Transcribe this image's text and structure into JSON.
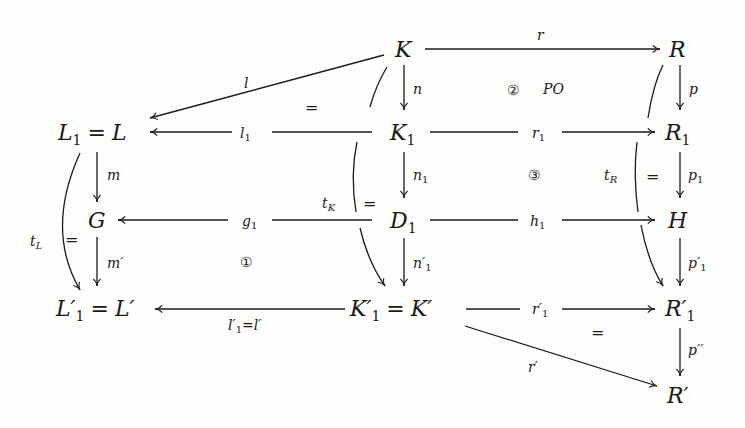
{
  "diagram": {
    "nodes": [
      {
        "id": "K",
        "label": "K",
        "x": 408,
        "y": 52
      },
      {
        "id": "R",
        "label": "R",
        "x": 682,
        "y": 52
      },
      {
        "id": "L1L",
        "label": "L₁ = L",
        "x": 108,
        "y": 135
      },
      {
        "id": "K1",
        "label": "K₁",
        "x": 404,
        "y": 135
      },
      {
        "id": "R1",
        "label": "R₁",
        "x": 682,
        "y": 135
      },
      {
        "id": "G",
        "label": "G",
        "x": 97,
        "y": 223
      },
      {
        "id": "D1",
        "label": "D₁",
        "x": 404,
        "y": 223
      },
      {
        "id": "H",
        "label": "H",
        "x": 680,
        "y": 223
      },
      {
        "id": "L1pLp",
        "label": "L′₁ = L′",
        "x": 118,
        "y": 310
      },
      {
        "id": "K1pKp",
        "label": "K′₁ = K′",
        "x": 393,
        "y": 310
      },
      {
        "id": "R1p",
        "label": "R′₁",
        "x": 682,
        "y": 310
      },
      {
        "id": "Rp",
        "label": "R′",
        "x": 682,
        "y": 395
      }
    ],
    "edges": [
      {
        "id": "r",
        "label": "r",
        "from": "K",
        "to": "R"
      },
      {
        "id": "l",
        "label": "l",
        "from": "K",
        "to": "L1L"
      },
      {
        "id": "n",
        "label": "n",
        "from": "K",
        "to": "K1"
      },
      {
        "id": "p",
        "label": "p",
        "from": "R",
        "to": "R1"
      },
      {
        "id": "l1",
        "label": "l₁",
        "from": "K1",
        "to": "L1L"
      },
      {
        "id": "r1",
        "label": "r₁",
        "from": "K1",
        "to": "R1"
      },
      {
        "id": "m",
        "label": "m",
        "from": "L1L",
        "to": "G"
      },
      {
        "id": "n1",
        "label": "n₁",
        "from": "K1",
        "to": "D1"
      },
      {
        "id": "p1",
        "label": "p₁",
        "from": "R1",
        "to": "H"
      },
      {
        "id": "g1",
        "label": "g₁",
        "from": "D1",
        "to": "G"
      },
      {
        "id": "h1",
        "label": "h₁",
        "from": "D1",
        "to": "H"
      },
      {
        "id": "mp",
        "label": "m′",
        "from": "G",
        "to": "L1pLp"
      },
      {
        "id": "n1p",
        "label": "n′₁",
        "from": "D1",
        "to": "K1pKp"
      },
      {
        "id": "p1p",
        "label": "p′₁",
        "from": "H",
        "to": "R1p"
      },
      {
        "id": "l1p",
        "label": "l′₁=l′",
        "from": "K1pKp",
        "to": "L1pLp"
      },
      {
        "id": "r1p",
        "label": "r′₁",
        "from": "K1pKp",
        "to": "R1p"
      },
      {
        "id": "ppp",
        "label": "p′′",
        "from": "R1p",
        "to": "Rp"
      },
      {
        "id": "rp",
        "label": "r′",
        "from": "K1pKp",
        "to": "Rp"
      },
      {
        "id": "tL",
        "label": "tL",
        "from": "L1L",
        "to": "L1pLp",
        "curved": true
      },
      {
        "id": "tK",
        "label": "tK",
        "from": "K",
        "to": "K1pKp",
        "curved": true
      },
      {
        "id": "tR",
        "label": "tR",
        "from": "R",
        "to": "R1p",
        "curved": true
      }
    ],
    "annotations": {
      "eq_top_left": "=",
      "eq_tL": "=",
      "eq_tK": "=",
      "eq_tR": "=",
      "eq_bottom_right": "=",
      "circle_1": "①",
      "circle_2": "②",
      "po_label": "PO",
      "circle_3": "③"
    },
    "labels": {
      "K": "K",
      "R": "R",
      "L1": "L",
      "L1_sub": "1",
      "eqL": "= L",
      "K1": "K",
      "K1_sub": "1",
      "R1": "R",
      "R1_sub": "1",
      "G": "G",
      "D1": "D",
      "D1_sub": "1",
      "H": "H",
      "L1p": "L′",
      "L1p_sub": "1",
      "eqLp": "= L′",
      "K1p": "K′",
      "K1p_sub": "1",
      "eqKp": "= K′",
      "R1p": "R′",
      "R1p_sub": "1",
      "Rp": "R′",
      "e_r": "r",
      "e_l": "l",
      "e_n": "n",
      "e_p": "p",
      "e_l1": "l",
      "e_l1_sub": "1",
      "e_r1": "r",
      "e_r1_sub": "1",
      "e_m": "m",
      "e_n1": "n",
      "e_n1_sub": "1",
      "e_p1": "p",
      "e_p1_sub": "1",
      "e_g1": "g",
      "e_g1_sub": "1",
      "e_h1": "h",
      "e_h1_sub": "1",
      "e_mp": "m′",
      "e_n1p": "n′",
      "e_n1p_sub": "1",
      "e_p1p": "p′",
      "e_p1p_sub": "1",
      "e_l1p": "l′",
      "e_l1p_sub": "1",
      "e_l1p_rest": "=l′",
      "e_r1p": "r′",
      "e_r1p_sub": "1",
      "e_ppp": "p′′",
      "e_rp": "r′",
      "t": "t",
      "tL_sub": "L",
      "tK_sub": "K",
      "tR_sub": "R"
    }
  }
}
